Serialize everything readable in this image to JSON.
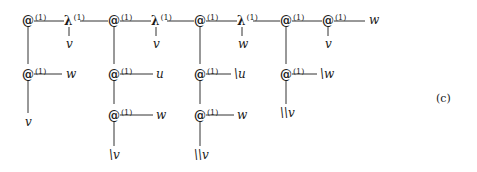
{
  "diagram": {
    "label": "(c)",
    "superscript": "(1)",
    "top_row": [
      {
        "sym": "@",
        "x": 22,
        "child": null
      },
      {
        "sym": "λ",
        "x": 64,
        "child": "v"
      },
      {
        "sym": "@",
        "x": 108,
        "child": null
      },
      {
        "sym": "λ",
        "x": 151,
        "child": "v"
      },
      {
        "sym": "@",
        "x": 194,
        "child": null
      },
      {
        "sym": "λ",
        "x": 237,
        "child": "w"
      },
      {
        "sym": "@",
        "x": 280,
        "child": null
      },
      {
        "sym": "@",
        "x": 322,
        "child": "v"
      }
    ],
    "top_right_leaf": "w",
    "columns": [
      {
        "nodes": [
          {
            "sym": "@",
            "right": "w"
          }
        ],
        "bottom": "v"
      },
      {
        "nodes": [
          {
            "sym": "@",
            "right": "u"
          },
          {
            "sym": "@",
            "right": "w"
          }
        ],
        "bottom": "\\v"
      },
      {
        "nodes": [
          {
            "sym": "@",
            "right": "\\u"
          },
          {
            "sym": "@",
            "right": "w"
          }
        ],
        "bottom": "\\\\v"
      },
      {
        "nodes": [
          {
            "sym": "@",
            "right": "\\w"
          }
        ],
        "bottom": "\\\\v"
      }
    ]
  }
}
